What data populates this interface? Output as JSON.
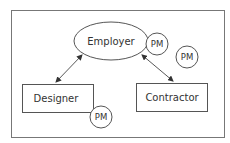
{
  "diagram": {
    "nodes": {
      "employer": {
        "label": "Employer",
        "shape": "ellipse"
      },
      "designer": {
        "label": "Designer",
        "shape": "rectangle"
      },
      "contractor": {
        "label": "Contractor",
        "shape": "rectangle"
      },
      "pm_employer": {
        "label": "PM",
        "shape": "circle"
      },
      "pm_free": {
        "label": "PM",
        "shape": "circle"
      },
      "pm_designer": {
        "label": "PM",
        "shape": "circle"
      }
    },
    "edges": [
      {
        "from": "employer",
        "to": "designer",
        "type": "bidirectional-arrow"
      },
      {
        "from": "employer",
        "to": "contractor",
        "type": "bidirectional-arrow"
      }
    ],
    "colors": {
      "line": "#555555",
      "text": "#333333",
      "background": "#ffffff"
    }
  }
}
